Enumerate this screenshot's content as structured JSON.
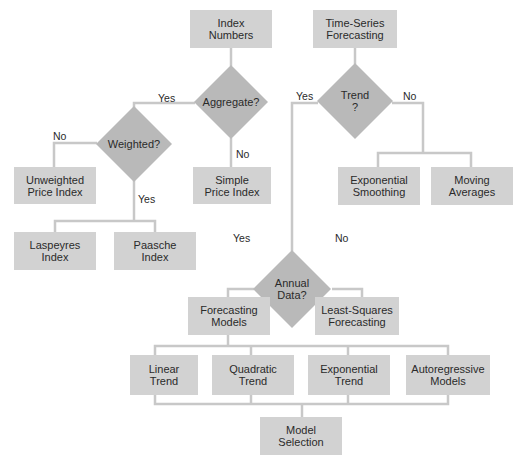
{
  "diagram": {
    "type": "flowchart",
    "colors": {
      "box_fill": "#d2d2d2",
      "diamond_fill": "#b9b9b9",
      "line": "#c8c8c8",
      "text": "#2a2a2a",
      "background": "#ffffff"
    },
    "nodes": {
      "index_numbers": "Index\nNumbers",
      "aggregate": "Aggregate?",
      "weighted": "Weighted?",
      "unweighted_price_index": "Unweighted\nPrice Index",
      "simple_price_index": "Simple\nPrice Index",
      "laspeyres_index": "Laspeyres\nIndex",
      "paasche_index": "Paasche\nIndex",
      "time_series_forecasting": "Time-Series\nForecasting",
      "trend": "Trend\n?",
      "exponential_smoothing": "Exponential\nSmoothing",
      "moving_averages": "Moving\nAverages",
      "annual_data": "Annual\nData?",
      "forecasting_models": "Forecasting\nModels",
      "least_squares_forecasting": "Least-Squares\nForecasting",
      "linear_trend": "Linear\nTrend",
      "quadratic_trend": "Quadratic\nTrend",
      "exponential_trend": "Exponential\nTrend",
      "autoregressive_models": "Autoregressive\nModels",
      "model_selection": "Model\nSelection"
    },
    "edge_labels": {
      "aggregate_yes": "Yes",
      "aggregate_no": "No",
      "weighted_no": "No",
      "weighted_yes": "Yes",
      "trend_yes": "Yes",
      "trend_no": "No",
      "annual_yes": "Yes",
      "annual_no": "No"
    },
    "edges": [
      {
        "from": "Index Numbers",
        "to": "Aggregate?"
      },
      {
        "from": "Aggregate?",
        "to": "Weighted?",
        "label": "Yes"
      },
      {
        "from": "Aggregate?",
        "to": "Simple Price Index",
        "label": "No"
      },
      {
        "from": "Weighted?",
        "to": "Unweighted Price Index",
        "label": "No"
      },
      {
        "from": "Weighted?",
        "to": "Laspeyres Index",
        "label": "Yes"
      },
      {
        "from": "Weighted?",
        "to": "Paasche Index",
        "label": "Yes"
      },
      {
        "from": "Time-Series Forecasting",
        "to": "Trend?"
      },
      {
        "from": "Trend?",
        "to": "Annual Data?",
        "label": "Yes"
      },
      {
        "from": "Trend?",
        "to": "Exponential Smoothing",
        "label": "No"
      },
      {
        "from": "Trend?",
        "to": "Moving Averages",
        "label": "No"
      },
      {
        "from": "Annual Data?",
        "to": "Forecasting Models",
        "label": "Yes"
      },
      {
        "from": "Annual Data?",
        "to": "Least-Squares Forecasting",
        "label": "No"
      },
      {
        "from": "Forecasting Models",
        "to": "Linear Trend"
      },
      {
        "from": "Forecasting Models",
        "to": "Quadratic Trend"
      },
      {
        "from": "Forecasting Models",
        "to": "Exponential Trend"
      },
      {
        "from": "Forecasting Models",
        "to": "Autoregressive Models"
      },
      {
        "from": "Linear Trend",
        "to": "Model Selection"
      },
      {
        "from": "Quadratic Trend",
        "to": "Model Selection"
      },
      {
        "from": "Exponential Trend",
        "to": "Model Selection"
      },
      {
        "from": "Autoregressive Models",
        "to": "Model Selection"
      }
    ]
  }
}
